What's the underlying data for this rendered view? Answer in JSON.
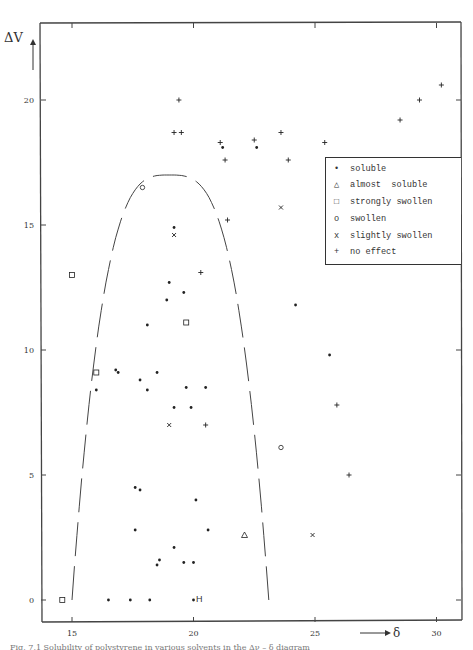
{
  "chart_data": {
    "type": "scatter",
    "title": "",
    "xlabel": "δ",
    "ylabel": "Δν",
    "xlim": [
      14.0,
      31.3
    ],
    "ylim": [
      -0.9,
      23.1
    ],
    "x_ticks": [
      15,
      20,
      25,
      30
    ],
    "y_ticks": [
      0,
      5,
      10,
      15,
      20
    ],
    "grid": false,
    "legend_position": "upper right (inside)",
    "legend": [
      {
        "symbol": "•",
        "label": "soluble"
      },
      {
        "symbol": "△",
        "label": "almost  soluble"
      },
      {
        "symbol": "□",
        "label": "strongly swollen"
      },
      {
        "symbol": "o",
        "label": "swollen"
      },
      {
        "symbol": "x",
        "label": "slightly swollen"
      },
      {
        "symbol": "+",
        "label": "no effect"
      }
    ],
    "series": [
      {
        "name": "soluble",
        "marker": "dot",
        "points": [
          [
            16.5,
            0
          ],
          [
            17.4,
            0
          ],
          [
            18.2,
            0
          ],
          [
            20.0,
            0
          ],
          [
            18.5,
            1.4
          ],
          [
            18.6,
            1.6
          ],
          [
            19.2,
            2.1
          ],
          [
            19.6,
            1.5
          ],
          [
            20.0,
            1.5
          ],
          [
            17.6,
            2.8
          ],
          [
            20.6,
            2.8
          ],
          [
            20.1,
            4.0
          ],
          [
            17.6,
            4.5
          ],
          [
            17.8,
            4.4
          ],
          [
            16.0,
            8.4
          ],
          [
            16.8,
            9.2
          ],
          [
            16.9,
            9.1
          ],
          [
            17.8,
            8.8
          ],
          [
            18.1,
            8.4
          ],
          [
            18.5,
            9.1
          ],
          [
            19.2,
            7.7
          ],
          [
            19.7,
            8.5
          ],
          [
            19.9,
            7.7
          ],
          [
            20.5,
            8.5
          ],
          [
            18.1,
            11.0
          ],
          [
            18.9,
            12.0
          ],
          [
            19.0,
            12.7
          ],
          [
            19.6,
            12.3
          ],
          [
            19.2,
            14.9
          ],
          [
            21.2,
            18.1
          ],
          [
            22.6,
            18.1
          ],
          [
            24.2,
            11.8
          ],
          [
            25.6,
            9.8
          ]
        ]
      },
      {
        "name": "almost soluble",
        "marker": "triangle",
        "points": [
          [
            22.1,
            2.6
          ]
        ]
      },
      {
        "name": "strongly swollen",
        "marker": "square",
        "points": [
          [
            14.6,
            0
          ],
          [
            15.0,
            13.0
          ],
          [
            16.0,
            9.1
          ],
          [
            19.7,
            11.1
          ]
        ]
      },
      {
        "name": "swollen",
        "marker": "circle",
        "points": [
          [
            17.9,
            16.5
          ],
          [
            23.6,
            6.1
          ]
        ]
      },
      {
        "name": "slightly swollen",
        "marker": "x",
        "points": [
          [
            19.2,
            14.6
          ],
          [
            19.0,
            7.0
          ],
          [
            23.6,
            15.7
          ],
          [
            24.9,
            2.6
          ]
        ]
      },
      {
        "name": "no effect",
        "marker": "plus",
        "points": [
          [
            19.4,
            20.0
          ],
          [
            19.2,
            18.7
          ],
          [
            19.5,
            18.7
          ],
          [
            21.1,
            18.3
          ],
          [
            21.3,
            17.6
          ],
          [
            22.5,
            18.4
          ],
          [
            23.6,
            18.7
          ],
          [
            23.9,
            17.6
          ],
          [
            25.4,
            18.3
          ],
          [
            28.5,
            19.2
          ],
          [
            29.3,
            20.0
          ],
          [
            30.2,
            20.6
          ],
          [
            21.4,
            15.2
          ],
          [
            20.3,
            13.1
          ],
          [
            20.5,
            7.0
          ],
          [
            25.9,
            7.8
          ],
          [
            26.4,
            5.0
          ]
        ]
      }
    ],
    "annotations": [
      {
        "text": "H",
        "x": 20.3,
        "y": 0.05
      },
      {
        "text": "dashed boundary curve enclosing solubility region (inverted parabola from δ≈15 to δ≈23.1, apex Δν≈17 at δ≈19)"
      }
    ]
  },
  "axes": {
    "y_label": "ΔV",
    "x_label": "δ",
    "x_arrow": "⟶",
    "y_tick_labels": [
      "0",
      "5",
      "10",
      "15",
      "20"
    ],
    "x_tick_labels": [
      "15",
      "20",
      "25",
      "30"
    ]
  },
  "legend": {
    "items": [
      {
        "symbol": "•",
        "label": "soluble"
      },
      {
        "symbol": "△",
        "label": "almost  soluble"
      },
      {
        "symbol": "□",
        "label": "strongly swollen"
      },
      {
        "symbol": "o",
        "label": "swollen"
      },
      {
        "symbol": "x",
        "label": "slightly swollen"
      },
      {
        "symbol": "+",
        "label": "no effect"
      }
    ]
  },
  "annotation_H": "H",
  "caption": "Fig. 7.1 Solubility of polystyrene in various solvents in the Δν – δ diagram"
}
